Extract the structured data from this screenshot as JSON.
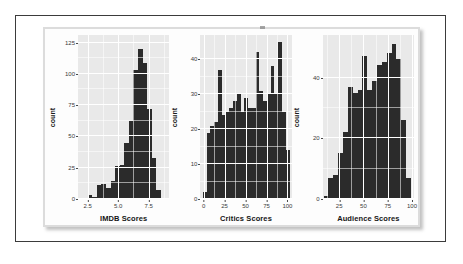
{
  "figure": {
    "panel_background": "#e9e9e9",
    "bar_color": "#2b2b2b",
    "gridline_color": "#ffffff",
    "frame_color": "#3b3b3b"
  },
  "chart_data": [
    {
      "type": "bar",
      "title": "",
      "xlabel": "IMDB Scores",
      "ylabel": "count",
      "xlim": [
        1.7,
        9.2
      ],
      "ylim": [
        0,
        131
      ],
      "xticks": [
        "2.5",
        "5.0",
        "7.5"
      ],
      "xtick_values": [
        2.5,
        5.0,
        7.5
      ],
      "yticks": [
        "0",
        "25",
        "50",
        "75",
        "100",
        "125"
      ],
      "ytick_values": [
        0,
        25,
        50,
        75,
        100,
        125
      ],
      "grid": true,
      "bin_width": 0.375,
      "bin_starts": [
        1.75,
        2.125,
        2.5,
        2.875,
        3.25,
        3.625,
        4.0,
        4.375,
        4.75,
        5.125,
        5.5,
        5.875,
        6.25,
        6.625,
        7.0,
        7.375,
        7.75,
        8.125,
        8.5
      ],
      "values": [
        1,
        1,
        3,
        2,
        11,
        12,
        9,
        14,
        26,
        27,
        45,
        62,
        103,
        120,
        109,
        72,
        33,
        7,
        1
      ]
    },
    {
      "type": "bar",
      "title": "",
      "xlabel": "Critics Scores",
      "ylabel": "count",
      "xlim": [
        -4,
        105
      ],
      "ylim": [
        0,
        47
      ],
      "xticks": [
        "0",
        "25",
        "50",
        "75",
        "100"
      ],
      "xtick_values": [
        0,
        25,
        50,
        75,
        100
      ],
      "yticks": [
        "0",
        "10",
        "20",
        "30",
        "40"
      ],
      "ytick_values": [
        0,
        10,
        20,
        30,
        40
      ],
      "grid": true,
      "bin_width": 4.5,
      "bin_starts": [
        -1,
        3.5,
        8,
        12.5,
        17,
        21.5,
        26,
        30.5,
        35,
        39.5,
        44,
        48.5,
        53,
        57.5,
        62,
        66.5,
        71,
        75.5,
        80,
        84.5,
        89,
        93.5,
        98
      ],
      "values": [
        2,
        19,
        21,
        22,
        37,
        24,
        25,
        26,
        28,
        30,
        25,
        29,
        26,
        26,
        42,
        31,
        28,
        30,
        38,
        30,
        45,
        25,
        14
      ]
    },
    {
      "type": "bar",
      "title": "",
      "xlabel": "Audience Scores",
      "ylabel": "count",
      "xlim": [
        8,
        102
      ],
      "ylim": [
        0,
        54
      ],
      "xticks": [
        "25",
        "50",
        "75",
        "100"
      ],
      "xtick_values": [
        25,
        50,
        75,
        100
      ],
      "yticks": [
        "0",
        "20",
        "40"
      ],
      "ytick_values": [
        0,
        20,
        40
      ],
      "grid": true,
      "bin_width": 5,
      "bin_starts": [
        9,
        14,
        19,
        24,
        29,
        34,
        39,
        44,
        49,
        54,
        59,
        64,
        69,
        74,
        79,
        84,
        89,
        94
      ],
      "values": [
        1,
        7,
        8,
        15,
        22,
        37,
        35,
        36,
        47,
        36,
        39,
        44,
        45,
        48,
        51,
        46,
        26,
        7
      ]
    }
  ]
}
